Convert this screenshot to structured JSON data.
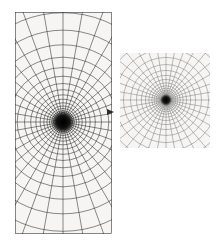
{
  "figure": {
    "title": "",
    "background_color": "#ffffff",
    "paper_color": "#f6f5f3",
    "line_color": "#2b2b2b",
    "faint_line_color": "#7d7d7d",
    "core_color": "#000000"
  },
  "chart_data": {
    "type": "scatter",
    "title": "",
    "subtitle": "",
    "xlabel": "",
    "ylabel": "",
    "grid": true,
    "legend_position": "none",
    "annotations": [
      "arrowhead-right"
    ],
    "panels": [
      {
        "name": "left-panel",
        "description": "polar grid of radial spokes and concentric circles clipped to a tall rectangle, dense dark core at centre",
        "shape": "portrait-rectangle",
        "x": 15,
        "y": 12,
        "width": 97,
        "height": 222,
        "center_x": 63,
        "center_y": 122,
        "radial_spokes": 36,
        "concentric_rings": 26,
        "ring_growth": 1.19,
        "ring_start_radius": 2.0,
        "core_radius": 12,
        "stroke_width": 0.55,
        "stroke_color": "#2b2b2b",
        "has_arrow": true,
        "arrow_x": 114,
        "arrow_y": 112
      },
      {
        "name": "right-panel",
        "description": "polar grid of radial spokes and concentric circles clipped to a square, small dark core at centre",
        "shape": "square",
        "x": 120,
        "y": 53,
        "width": 90,
        "height": 95,
        "center_x": 166,
        "center_y": 100,
        "radial_spokes": 36,
        "concentric_rings": 22,
        "ring_growth": 1.2,
        "ring_start_radius": 1.6,
        "core_radius": 6,
        "stroke_width": 0.45,
        "stroke_color": "#6e6e6e",
        "has_arrow": false,
        "arrow_x": 0,
        "arrow_y": 0
      }
    ],
    "ylim": [
      0,
      246
    ],
    "xlim": [
      0,
      220
    ]
  }
}
